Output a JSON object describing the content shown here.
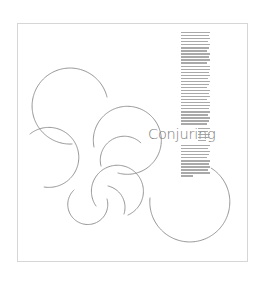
{
  "poster": {
    "title": "Conjuring",
    "colors": {
      "background": "#ffffff",
      "frame": "#d6d6d6",
      "arc_stroke": "#8c8c8c",
      "title": "#7a7a7a",
      "body_text": "#9a9a9a"
    },
    "body_column": {
      "legible": false,
      "upper_lines": 31,
      "side_lines": 5,
      "lower_lines": 11
    },
    "arcs": [
      {
        "id": "arc-a",
        "cx": 73,
        "cy": 106,
        "r": 38
      },
      {
        "id": "arc-b",
        "cx": 50,
        "cy": 158,
        "r": 30
      },
      {
        "id": "arc-c",
        "cx": 127,
        "cy": 140,
        "r": 34
      },
      {
        "id": "arc-d",
        "cx": 118,
        "cy": 148,
        "r": 24
      },
      {
        "id": "arc-e",
        "cx": 118,
        "cy": 192,
        "r": 26
      },
      {
        "id": "arc-f",
        "cx": 88,
        "cy": 205,
        "r": 20
      },
      {
        "id": "arc-g",
        "cx": 190,
        "cy": 202,
        "r": 40
      }
    ]
  }
}
